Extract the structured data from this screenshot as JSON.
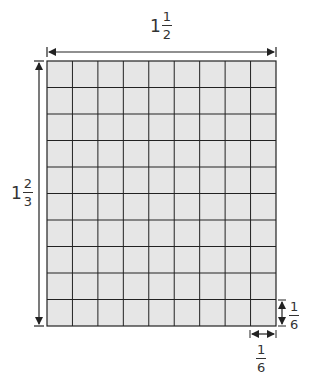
{
  "diagram": {
    "grid": {
      "columns": 9,
      "rows": 10,
      "fill": "#e6e6e6",
      "line_color": "#222222"
    },
    "width_label": {
      "whole": "1",
      "numerator": "1",
      "denominator": "2"
    },
    "height_label": {
      "whole": "1",
      "numerator": "2",
      "denominator": "3"
    },
    "cell_height_label": {
      "numerator": "1",
      "denominator": "6"
    },
    "cell_width_label": {
      "numerator": "1",
      "denominator": "6"
    }
  }
}
